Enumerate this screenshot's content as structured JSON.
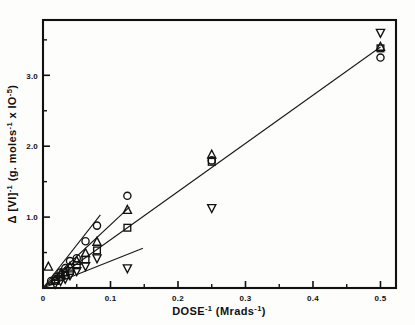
{
  "figure": {
    "background_color": "#fdfdfc",
    "ink_color": "#111111"
  },
  "axes": {
    "x_title_main": "DOSE",
    "x_title_sup1": "-1",
    "x_title_unit_open": " (Mrads",
    "x_title_sup2": "-1",
    "x_title_unit_close": ")",
    "x_title_full": "DOSE-1 (Mrads-1)",
    "y_title_delta": "Δ",
    "y_title_bracket": " [VI]",
    "y_title_sup1": "-1",
    "y_title_unit": " (g. moles",
    "y_title_sup2": "-1",
    "y_title_mid": " x IO",
    "y_title_sup3": "-5",
    "y_title_close": ")",
    "y_title_full": "Δ [VI]-1 (g. moles-1 x IO-5)",
    "x_ticklabels": [
      "0",
      "0.1",
      "0.2",
      "0.3",
      "0.4",
      "0.5"
    ],
    "y_ticklabels": [
      "1.0",
      "2.0",
      "3.0"
    ]
  },
  "chart_data": {
    "type": "scatter",
    "title": "",
    "xlabel": "DOSE-1 (Mrads-1)",
    "ylabel": "Δ [VI]-1 (g. moles-1 x IO-5)",
    "xlim": [
      0,
      0.523
    ],
    "ylim": [
      0,
      3.78
    ],
    "xticks": [
      0,
      0.1,
      0.2,
      0.3,
      0.4,
      0.5
    ],
    "xticks_minor": [
      0.05,
      0.15,
      0.25,
      0.35,
      0.45
    ],
    "yticks": [
      1.0,
      2.0,
      3.0
    ],
    "yticks_minor": [
      0.5,
      1.5,
      2.5,
      3.5
    ],
    "grid": false,
    "legend": "none",
    "frame": "box",
    "series": [
      {
        "name": "circle-series",
        "marker": "circle",
        "x": [
          0.012,
          0.02,
          0.026,
          0.033,
          0.04,
          0.05,
          0.063,
          0.08,
          0.125,
          0.25,
          0.5
        ],
        "y": [
          0.1,
          0.16,
          0.22,
          0.28,
          0.38,
          0.42,
          0.66,
          0.88,
          1.3,
          1.8,
          3.25
        ],
        "fit_line": {
          "x0": 0.0,
          "y0": 0.0,
          "x1": 0.085,
          "y1": 1.03
        }
      },
      {
        "name": "triangle-up-series",
        "marker": "triangle-up",
        "x": [
          0.008,
          0.018,
          0.026,
          0.033,
          0.04,
          0.05,
          0.063,
          0.08,
          0.125,
          0.25,
          0.5
        ],
        "y": [
          0.3,
          0.12,
          0.2,
          0.22,
          0.3,
          0.38,
          0.49,
          0.65,
          1.1,
          1.88,
          3.4
        ],
        "fit_line": {
          "x0": 0.0,
          "y0": 0.0,
          "x1": 0.128,
          "y1": 1.14
        }
      },
      {
        "name": "square-series",
        "marker": "square",
        "x": [
          0.018,
          0.026,
          0.033,
          0.04,
          0.05,
          0.063,
          0.08,
          0.125,
          0.25,
          0.5
        ],
        "y": [
          0.1,
          0.16,
          0.18,
          0.24,
          0.32,
          0.4,
          0.53,
          0.85,
          1.78,
          3.38
        ],
        "fit_line": {
          "x0": 0.0,
          "y0": 0.0,
          "x1": 0.5,
          "y1": 3.4
        }
      },
      {
        "name": "triangle-down-series",
        "marker": "triangle-down",
        "x": [
          0.018,
          0.026,
          0.033,
          0.04,
          0.05,
          0.063,
          0.08,
          0.125,
          0.25,
          0.5
        ],
        "y": [
          0.06,
          0.1,
          0.13,
          0.18,
          0.24,
          0.31,
          0.42,
          0.28,
          1.13,
          3.6
        ],
        "fit_line": {
          "x0": 0.0,
          "y0": 0.0,
          "x1": 0.148,
          "y1": 0.56
        }
      }
    ]
  }
}
